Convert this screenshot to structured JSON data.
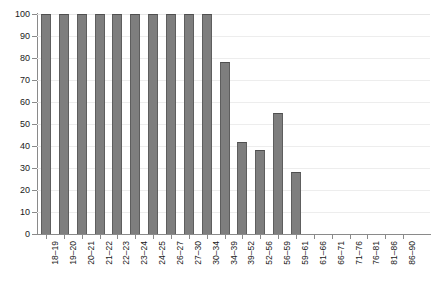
{
  "chart_data": {
    "type": "bar",
    "title": "",
    "subtitle": "",
    "xlabel": "",
    "ylabel": "",
    "ylim": [
      0,
      100
    ],
    "yticks": [
      0,
      10,
      20,
      30,
      40,
      50,
      60,
      70,
      80,
      90,
      100
    ],
    "grid": true,
    "legend": false,
    "legend_position": "none",
    "bar_color": "#7e7e7e",
    "bar_edge_color": "#5e5e5e",
    "gridline_color": "#ededed",
    "axis_color": "#8a8a8a",
    "categories": [
      "18–19",
      "19–20",
      "20–21",
      "21–22",
      "22–23",
      "23–24",
      "24–25",
      "26–27",
      "27–30",
      "30–34",
      "34–39",
      "39–52",
      "52–56",
      "56–59",
      "59–61",
      "61–66",
      "66–71",
      "71–76",
      "76–81",
      "81–86",
      "86–90"
    ],
    "values": [
      100,
      100,
      100,
      100,
      100,
      100,
      100,
      100,
      100,
      100,
      78,
      42,
      38,
      55,
      28,
      0,
      0,
      0,
      0,
      0,
      0
    ]
  }
}
